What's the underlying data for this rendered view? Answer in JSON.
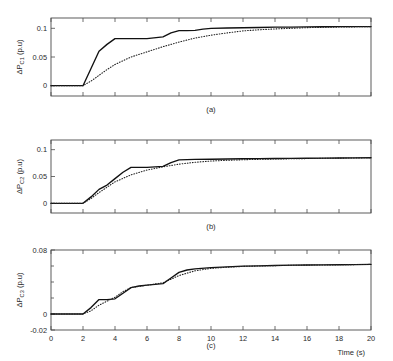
{
  "figure": {
    "background": "#ffffff",
    "solid_color": "#111111",
    "dotted_color": "#222222",
    "axis_color": "#4a4a4a",
    "xlabel": "Time (s)",
    "xticks": [
      0,
      2,
      4,
      6,
      8,
      10,
      12,
      14,
      16,
      18,
      20
    ],
    "xlim": [
      0,
      20
    ]
  },
  "chart_data": [
    {
      "type": "line",
      "panel": "a",
      "caption": "(a)",
      "title": "",
      "xlabel": "",
      "ylabel": "ΔP_C1 (p.u)",
      "ylabel_display": "P",
      "ylabel_sub": "C1",
      "ylabel_unit": " (p.u)",
      "xlim": [
        0,
        20
      ],
      "ylim": [
        -0.018,
        0.118
      ],
      "xticks": [
        0,
        2,
        4,
        6,
        8,
        10,
        12,
        14,
        16,
        18,
        20
      ],
      "yticks": [
        0,
        0.05,
        0.1
      ],
      "ytick_labels": [
        "0",
        "0.05",
        "0.1"
      ],
      "grid": false,
      "legend": "none",
      "series": [
        {
          "name": "solid",
          "style": "solid",
          "x": [
            0,
            1,
            2,
            2.5,
            3,
            3.5,
            4,
            4.5,
            5,
            6,
            7,
            7.5,
            8,
            8.5,
            9,
            9.5,
            10,
            11,
            12,
            13,
            14,
            15,
            16,
            17,
            18,
            19,
            20
          ],
          "values": [
            0,
            0,
            0,
            0.03,
            0.06,
            0.072,
            0.082,
            0.082,
            0.082,
            0.082,
            0.085,
            0.092,
            0.096,
            0.096,
            0.0965,
            0.0985,
            0.1,
            0.1005,
            0.101,
            0.1015,
            0.102,
            0.1022,
            0.1025,
            0.1028,
            0.103,
            0.103,
            0.103
          ]
        },
        {
          "name": "dotted",
          "style": "dotted",
          "x": [
            0,
            1,
            2,
            2.5,
            3,
            3.5,
            4,
            5,
            6,
            7,
            8,
            9,
            10,
            11,
            12,
            13,
            14,
            15,
            16,
            17,
            18,
            19,
            20
          ],
          "values": [
            0,
            0,
            0,
            0.008,
            0.018,
            0.028,
            0.037,
            0.05,
            0.059,
            0.068,
            0.076,
            0.083,
            0.088,
            0.092,
            0.0955,
            0.0975,
            0.099,
            0.1,
            0.1012,
            0.1018,
            0.1022,
            0.1026,
            0.103
          ]
        }
      ]
    },
    {
      "type": "line",
      "panel": "b",
      "caption": "(b)",
      "title": "",
      "xlabel": "",
      "ylabel": "ΔP_C2 (p.u)",
      "ylabel_display": "P",
      "ylabel_sub": "C2",
      "ylabel_unit": " (p.u)",
      "xlim": [
        0,
        20
      ],
      "ylim": [
        -0.018,
        0.118
      ],
      "xticks": [
        0,
        2,
        4,
        6,
        8,
        10,
        12,
        14,
        16,
        18,
        20
      ],
      "yticks": [
        0,
        0.05,
        0.1
      ],
      "ytick_labels": [
        "0",
        "0.05",
        "0.1"
      ],
      "grid": false,
      "legend": "none",
      "series": [
        {
          "name": "solid",
          "style": "solid",
          "x": [
            0,
            1,
            2,
            2.5,
            3,
            3.5,
            4,
            4.5,
            5,
            5.5,
            6,
            6.5,
            7,
            7.5,
            8,
            9,
            10,
            11,
            12,
            13,
            14,
            15,
            16,
            17,
            18,
            19,
            20
          ],
          "values": [
            0,
            0,
            0,
            0.012,
            0.026,
            0.034,
            0.046,
            0.058,
            0.067,
            0.067,
            0.067,
            0.068,
            0.069,
            0.076,
            0.081,
            0.0818,
            0.0822,
            0.0826,
            0.083,
            0.0832,
            0.0835,
            0.0838,
            0.084,
            0.0842,
            0.0844,
            0.0846,
            0.085
          ]
        },
        {
          "name": "dotted",
          "style": "dotted",
          "x": [
            0,
            1,
            2,
            2.5,
            3,
            3.5,
            4,
            5,
            6,
            7,
            8,
            9,
            10,
            11,
            12,
            13,
            14,
            15,
            16,
            17,
            18,
            19,
            20
          ],
          "values": [
            0,
            0,
            0,
            0.009,
            0.02,
            0.03,
            0.04,
            0.053,
            0.062,
            0.068,
            0.073,
            0.0765,
            0.0788,
            0.0802,
            0.0812,
            0.082,
            0.0826,
            0.083,
            0.0834,
            0.0838,
            0.0842,
            0.0846,
            0.085
          ]
        }
      ]
    },
    {
      "type": "line",
      "panel": "c",
      "caption": "(c)",
      "title": "",
      "xlabel": "Time (s)",
      "ylabel": "ΔP_C3 (p.u)",
      "ylabel_display": "P",
      "ylabel_sub": "C3",
      "ylabel_unit": " (p.u)",
      "xlim": [
        0,
        20
      ],
      "ylim": [
        -0.02,
        0.08
      ],
      "xticks": [
        0,
        2,
        4,
        6,
        8,
        10,
        12,
        14,
        16,
        18,
        20
      ],
      "yticks": [
        -0.02,
        0,
        0.08
      ],
      "ytick_labels": [
        "-0.02",
        "0",
        "0.08"
      ],
      "minor_yticks": [
        0.02,
        0.04,
        0.06
      ],
      "grid": false,
      "legend": "none",
      "series": [
        {
          "name": "solid",
          "style": "solid",
          "x": [
            0,
            1,
            2,
            2.5,
            3,
            3.5,
            4,
            4.5,
            5,
            5.5,
            6,
            6.5,
            7,
            7.5,
            8,
            8.5,
            9,
            10,
            11,
            12,
            13,
            14,
            15,
            16,
            17,
            18,
            19,
            20
          ],
          "values": [
            0,
            0,
            0,
            0.008,
            0.018,
            0.018,
            0.019,
            0.026,
            0.033,
            0.035,
            0.036,
            0.037,
            0.038,
            0.045,
            0.052,
            0.055,
            0.0565,
            0.058,
            0.059,
            0.0598,
            0.0602,
            0.0606,
            0.061,
            0.0612,
            0.0614,
            0.0616,
            0.0618,
            0.062
          ]
        },
        {
          "name": "dotted",
          "style": "dotted",
          "x": [
            0,
            1,
            2,
            2.5,
            3,
            3.5,
            4,
            4.5,
            5,
            6,
            7,
            8,
            9,
            10,
            11,
            12,
            13,
            14,
            15,
            16,
            17,
            18,
            19,
            20
          ],
          "values": [
            0,
            0,
            0,
            0.004,
            0.011,
            0.016,
            0.021,
            0.028,
            0.033,
            0.036,
            0.039,
            0.048,
            0.054,
            0.057,
            0.0585,
            0.0595,
            0.06,
            0.0605,
            0.0608,
            0.0611,
            0.0613,
            0.0615,
            0.0618,
            0.062
          ]
        }
      ]
    }
  ]
}
